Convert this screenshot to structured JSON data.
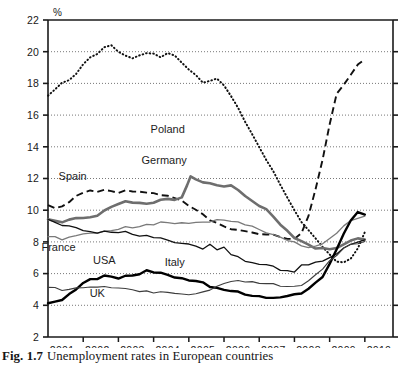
{
  "figure": {
    "caption_prefix": "Fig. 1.7",
    "caption_text": "Unemployment rates in European countries"
  },
  "axes": {
    "y_unit_label": "%",
    "y_ticks": [
      "22",
      "20",
      "18",
      "16",
      "14",
      "12",
      "10",
      "8",
      "6",
      "4",
      "2"
    ],
    "x_ticks": [
      "2001",
      "2002",
      "2003",
      "2004",
      "2005",
      "2006",
      "2007",
      "2008",
      "2009",
      "2010"
    ]
  },
  "series_labels": {
    "poland": "Poland",
    "germany": "Germany",
    "spain": "Spain",
    "france": "France",
    "usa": "USA",
    "italy": "Italy",
    "uk": "UK"
  },
  "colors": {
    "axis": "#1a1a1a",
    "gridline": "#555555",
    "poland": "#111111",
    "spain": "#111111",
    "germany": "#6e6e6e",
    "france": "#7a7a7a",
    "italy": "#111111",
    "usa": "#000000",
    "uk": "#3d3d3d",
    "background": "#ffffff"
  },
  "chart_data": {
    "type": "line",
    "title": "Unemployment rates in European countries",
    "xlabel": "",
    "ylabel": "%",
    "ylim": [
      2,
      22
    ],
    "xlim": [
      2000.6,
      2010.4
    ],
    "ytick_step": 2,
    "grid": "horizontal-dotted",
    "legend": "inline-labels",
    "series": [
      {
        "name": "Poland",
        "style": "dotted",
        "color": "#111111",
        "x": [
          2000.6,
          2000.8,
          2001.0,
          2001.2,
          2001.4,
          2001.6,
          2001.8,
          2002.0,
          2002.2,
          2002.4,
          2002.6,
          2002.8,
          2003.0,
          2003.2,
          2003.4,
          2003.6,
          2003.8,
          2004.0,
          2004.2,
          2004.4,
          2004.6,
          2004.8,
          2005.0,
          2005.2,
          2005.4,
          2005.6,
          2005.8,
          2006.0,
          2006.2,
          2006.4,
          2006.6,
          2006.8,
          2007.0,
          2007.2,
          2007.4,
          2007.6,
          2007.8,
          2008.0,
          2008.2,
          2008.4,
          2008.6,
          2008.8,
          2009.0,
          2009.2,
          2009.4,
          2009.6
        ],
        "y": [
          17.2,
          17.6,
          18.1,
          18.2,
          18.6,
          19.2,
          19.6,
          19.9,
          20.3,
          20.4,
          20.0,
          19.7,
          19.6,
          19.8,
          19.9,
          19.9,
          19.6,
          19.9,
          19.8,
          19.3,
          18.9,
          18.5,
          18.0,
          18.2,
          18.3,
          17.9,
          17.2,
          16.4,
          15.6,
          14.8,
          14.0,
          13.2,
          12.4,
          11.6,
          10.8,
          10.0,
          9.3,
          8.7,
          8.2,
          7.7,
          7.2,
          6.8,
          6.7,
          6.9,
          7.6,
          8.6
        ]
      },
      {
        "name": "Spain",
        "style": "dashed",
        "color": "#111111",
        "x": [
          2000.6,
          2000.8,
          2001.0,
          2001.2,
          2001.4,
          2001.6,
          2001.8,
          2002.0,
          2002.2,
          2002.4,
          2002.6,
          2002.8,
          2003.0,
          2003.2,
          2003.4,
          2003.6,
          2003.8,
          2004.0,
          2004.2,
          2004.4,
          2004.6,
          2004.8,
          2005.0,
          2005.2,
          2005.4,
          2005.6,
          2005.8,
          2006.0,
          2006.2,
          2006.4,
          2006.6,
          2006.8,
          2007.0,
          2007.2,
          2007.4,
          2007.6,
          2007.8,
          2008.0,
          2008.2,
          2008.4,
          2008.6,
          2008.8,
          2009.0,
          2009.2,
          2009.4,
          2009.6
        ],
        "y": [
          10.3,
          10.1,
          10.3,
          10.5,
          10.9,
          11.1,
          11.2,
          11.2,
          11.3,
          11.2,
          11.1,
          11.2,
          11.2,
          11.2,
          11.1,
          11.1,
          10.9,
          10.9,
          10.8,
          10.6,
          10.3,
          10.0,
          9.7,
          9.4,
          9.2,
          9.0,
          8.8,
          8.7,
          8.7,
          8.6,
          8.5,
          8.5,
          8.4,
          8.3,
          8.2,
          8.2,
          8.6,
          9.6,
          11.3,
          13.2,
          15.4,
          17.4,
          17.9,
          18.5,
          19.2,
          19.5
        ]
      },
      {
        "name": "Germany",
        "style": "thick-grey",
        "color": "#6e6e6e",
        "x": [
          2000.6,
          2000.8,
          2001.0,
          2001.2,
          2001.4,
          2001.6,
          2001.8,
          2002.0,
          2002.2,
          2002.4,
          2002.6,
          2002.8,
          2003.0,
          2003.2,
          2003.4,
          2003.6,
          2003.8,
          2004.0,
          2004.2,
          2004.4,
          2004.55,
          2004.65,
          2004.8,
          2005.0,
          2005.2,
          2005.4,
          2005.6,
          2005.8,
          2006.0,
          2006.2,
          2006.4,
          2006.6,
          2006.8,
          2007.0,
          2007.2,
          2007.4,
          2007.6,
          2007.8,
          2008.0,
          2008.2,
          2008.4,
          2008.6,
          2008.8,
          2009.0,
          2009.2,
          2009.4,
          2009.6
        ],
        "y": [
          9.4,
          9.3,
          9.3,
          9.4,
          9.5,
          9.5,
          9.5,
          9.7,
          10.0,
          10.2,
          10.4,
          10.5,
          10.5,
          10.5,
          10.4,
          10.5,
          10.6,
          10.7,
          10.7,
          10.8,
          11.6,
          12.1,
          11.9,
          11.8,
          11.7,
          11.6,
          11.5,
          11.5,
          11.3,
          10.9,
          10.6,
          10.3,
          10.0,
          9.6,
          9.1,
          8.7,
          8.3,
          8.0,
          7.8,
          7.6,
          7.6,
          7.6,
          7.6,
          7.8,
          8.1,
          8.2,
          8.2
        ]
      },
      {
        "name": "France",
        "style": "grey-thin",
        "color": "#7a7a7a",
        "x": [
          2000.6,
          2000.8,
          2001.0,
          2001.2,
          2001.4,
          2001.6,
          2001.8,
          2002.0,
          2002.2,
          2002.4,
          2002.6,
          2002.8,
          2003.0,
          2003.2,
          2003.4,
          2003.6,
          2003.8,
          2004.0,
          2004.2,
          2004.4,
          2004.6,
          2004.8,
          2005.0,
          2005.2,
          2005.4,
          2005.6,
          2005.8,
          2006.0,
          2006.2,
          2006.4,
          2006.6,
          2006.8,
          2007.0,
          2007.2,
          2007.4,
          2007.6,
          2007.8,
          2008.0,
          2008.2,
          2008.4,
          2008.6,
          2008.8,
          2009.0,
          2009.2,
          2009.4,
          2009.6
        ],
        "y": [
          8.3,
          8.3,
          8.2,
          8.3,
          8.4,
          8.5,
          8.5,
          8.6,
          8.7,
          8.7,
          8.8,
          8.9,
          8.9,
          9.0,
          9.1,
          9.1,
          9.2,
          9.2,
          9.2,
          9.2,
          9.2,
          9.2,
          9.2,
          9.3,
          9.4,
          9.4,
          9.3,
          9.2,
          9.1,
          9.0,
          8.8,
          8.6,
          8.4,
          8.3,
          8.1,
          8.0,
          7.8,
          7.6,
          7.7,
          7.9,
          8.2,
          8.6,
          9.0,
          9.3,
          9.5,
          9.6
        ]
      },
      {
        "name": "Italy",
        "style": "thin-black",
        "color": "#111111",
        "x": [
          2000.6,
          2000.8,
          2001.0,
          2001.2,
          2001.4,
          2001.6,
          2001.8,
          2002.0,
          2002.2,
          2002.4,
          2002.6,
          2002.8,
          2003.0,
          2003.2,
          2003.4,
          2003.6,
          2003.8,
          2004.0,
          2004.2,
          2004.4,
          2004.6,
          2004.8,
          2005.0,
          2005.2,
          2005.4,
          2005.6,
          2005.8,
          2006.0,
          2006.2,
          2006.4,
          2006.6,
          2006.8,
          2007.0,
          2007.2,
          2007.4,
          2007.6,
          2007.8,
          2008.0,
          2008.2,
          2008.4,
          2008.6,
          2008.8,
          2009.0,
          2009.2,
          2009.4,
          2009.6
        ],
        "y": [
          9.4,
          9.2,
          9.1,
          9.0,
          8.9,
          8.7,
          8.6,
          8.6,
          8.7,
          8.6,
          8.6,
          8.6,
          8.5,
          8.4,
          8.4,
          8.3,
          8.2,
          8.1,
          8.0,
          7.9,
          7.9,
          7.7,
          7.5,
          7.9,
          7.5,
          7.7,
          7.2,
          7.0,
          6.8,
          6.7,
          6.6,
          6.6,
          6.4,
          6.2,
          6.2,
          6.1,
          6.6,
          6.5,
          6.7,
          6.8,
          7.0,
          7.3,
          7.6,
          7.8,
          8.0,
          8.1
        ]
      },
      {
        "name": "USA",
        "style": "thick-black",
        "color": "#000000",
        "x": [
          2000.6,
          2000.8,
          2001.0,
          2001.2,
          2001.4,
          2001.6,
          2001.8,
          2002.0,
          2002.2,
          2002.4,
          2002.6,
          2002.8,
          2003.0,
          2003.2,
          2003.4,
          2003.6,
          2003.8,
          2004.0,
          2004.2,
          2004.4,
          2004.6,
          2004.8,
          2005.0,
          2005.2,
          2005.4,
          2005.6,
          2005.8,
          2006.0,
          2006.2,
          2006.4,
          2006.6,
          2006.8,
          2007.0,
          2007.2,
          2007.4,
          2007.6,
          2007.8,
          2008.0,
          2008.2,
          2008.4,
          2008.6,
          2008.8,
          2009.0,
          2009.2,
          2009.4,
          2009.6
        ],
        "y": [
          4.1,
          4.2,
          4.4,
          4.7,
          5.0,
          5.4,
          5.6,
          5.7,
          5.9,
          5.8,
          5.7,
          5.8,
          5.9,
          6.0,
          6.2,
          6.1,
          6.0,
          5.9,
          5.8,
          5.7,
          5.6,
          5.5,
          5.4,
          5.2,
          5.1,
          5.0,
          4.9,
          4.8,
          4.7,
          4.6,
          4.6,
          4.5,
          4.4,
          4.5,
          4.6,
          4.7,
          4.8,
          5.0,
          5.4,
          5.8,
          6.6,
          7.6,
          8.5,
          9.3,
          9.9,
          9.7
        ]
      },
      {
        "name": "UK",
        "style": "thin-grey-black",
        "color": "#3d3d3d",
        "x": [
          2000.6,
          2000.8,
          2001.0,
          2001.2,
          2001.4,
          2001.6,
          2001.8,
          2002.0,
          2002.2,
          2002.4,
          2002.6,
          2002.8,
          2003.0,
          2003.2,
          2003.4,
          2003.6,
          2003.8,
          2004.0,
          2004.2,
          2004.4,
          2004.6,
          2004.8,
          2005.0,
          2005.2,
          2005.4,
          2005.6,
          2005.8,
          2006.0,
          2006.2,
          2006.4,
          2006.6,
          2006.8,
          2007.0,
          2007.2,
          2007.4,
          2007.6,
          2007.8,
          2008.0,
          2008.2,
          2008.4,
          2008.6,
          2008.8,
          2009.0,
          2009.2,
          2009.4,
          2009.6
        ],
        "y": [
          5.1,
          5.1,
          5.0,
          5.0,
          5.1,
          5.1,
          5.1,
          5.2,
          5.2,
          5.1,
          5.1,
          5.0,
          5.0,
          4.9,
          4.9,
          4.8,
          4.8,
          4.8,
          4.8,
          4.7,
          4.7,
          4.7,
          4.8,
          5.0,
          5.2,
          5.4,
          5.5,
          5.5,
          5.5,
          5.5,
          5.4,
          5.4,
          5.3,
          5.2,
          5.2,
          5.2,
          5.3,
          5.5,
          5.9,
          6.3,
          6.8,
          7.2,
          7.6,
          7.8,
          7.9,
          8.0
        ]
      }
    ],
    "annotations": [
      {
        "text": "Poland",
        "x": 2004.0,
        "y": 14.9
      },
      {
        "text": "Germany",
        "x": 2003.9,
        "y": 12.9
      },
      {
        "text": "Spain",
        "x": 2001.3,
        "y": 11.9
      },
      {
        "text": "France",
        "x": 2000.9,
        "y": 7.4
      },
      {
        "text": "USA",
        "x": 2002.2,
        "y": 6.6
      },
      {
        "text": "Italy",
        "x": 2004.2,
        "y": 6.5
      },
      {
        "text": "UK",
        "x": 2002.0,
        "y": 4.5
      }
    ]
  }
}
